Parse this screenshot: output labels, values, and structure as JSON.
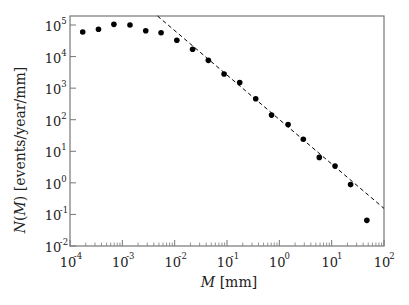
{
  "chart_data": {
    "type": "scatter",
    "title": "",
    "xlabel": "M [mm]",
    "ylabel": "N(M) [events/year/mm]",
    "xscale": "log",
    "yscale": "log",
    "xlim": [
      0.0001,
      100
    ],
    "ylim": [
      0.01,
      200000
    ],
    "x_ticks": [
      0.0001,
      0.001,
      0.01,
      0.1,
      1,
      10,
      100
    ],
    "x_tick_labels": [
      {
        "base": "10",
        "exp": "-4"
      },
      {
        "base": "10",
        "exp": "-3"
      },
      {
        "base": "10",
        "exp": "-2"
      },
      {
        "base": "10",
        "exp": "-1"
      },
      {
        "base": "10",
        "exp": "0"
      },
      {
        "base": "10",
        "exp": "1"
      },
      {
        "base": "10",
        "exp": "2"
      }
    ],
    "y_ticks": [
      0.01,
      0.1,
      1,
      10,
      100,
      1000,
      10000,
      100000
    ],
    "y_tick_labels": [
      {
        "base": "10",
        "exp": "-2"
      },
      {
        "base": "10",
        "exp": "-1"
      },
      {
        "base": "10",
        "exp": "0"
      },
      {
        "base": "10",
        "exp": "1"
      },
      {
        "base": "10",
        "exp": "2"
      },
      {
        "base": "10",
        "exp": "3"
      },
      {
        "base": "10",
        "exp": "4"
      },
      {
        "base": "10",
        "exp": "5"
      }
    ],
    "grid": false,
    "legend": null,
    "series": [
      {
        "name": "measured",
        "style": "markers",
        "color": "#000000",
        "x": [
          0.000175,
          0.00035,
          0.00069,
          0.0014,
          0.0028,
          0.0055,
          0.011,
          0.022,
          0.044,
          0.088,
          0.175,
          0.354,
          0.71,
          1.47,
          2.87,
          5.8,
          11.6,
          23,
          47
        ],
        "y": [
          60000,
          73000,
          105000,
          100000,
          66000,
          57000,
          33000,
          17000,
          7600,
          2800,
          1500,
          460,
          140,
          70,
          24,
          6.4,
          3.4,
          0.88,
          0.065
        ]
      },
      {
        "name": "power-law fit",
        "style": "dashed-line",
        "color": "#000000",
        "slope": -1.41,
        "x": [
          0.0047,
          100
        ],
        "y": [
          193000,
          0.155
        ]
      }
    ]
  }
}
